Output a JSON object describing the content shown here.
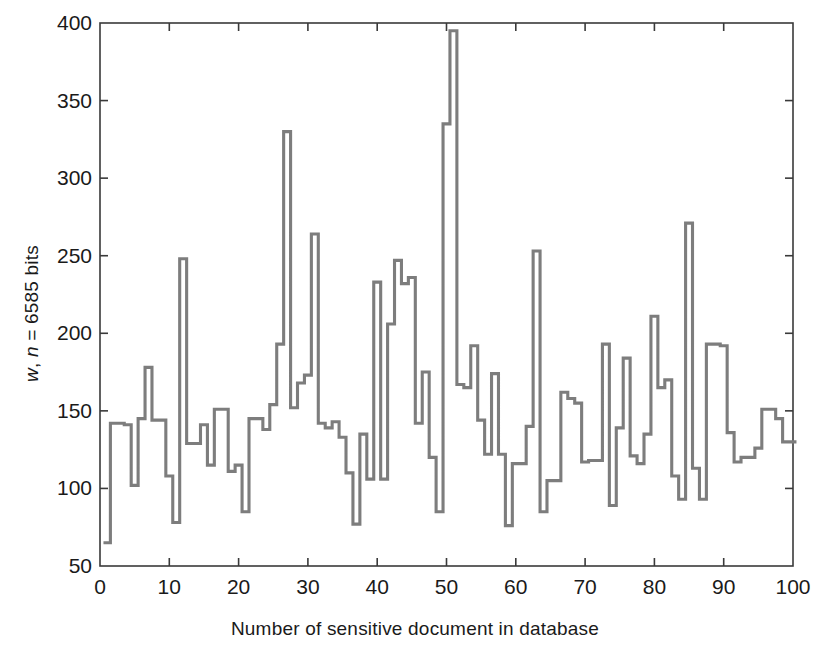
{
  "chart_data": {
    "type": "line",
    "subtype": "stairs",
    "title": "",
    "xlabel": "Number of sensitive document in database",
    "ylabel": "w, n = 6585 bits",
    "ylabel_parts": [
      {
        "text": "w",
        "italic": true
      },
      {
        "text": ", ",
        "italic": false
      },
      {
        "text": "n",
        "italic": true
      },
      {
        "text": " = 6585 bits",
        "italic": false
      }
    ],
    "xlim": [
      0,
      100
    ],
    "ylim": [
      50,
      400
    ],
    "xticks": [
      0,
      10,
      20,
      30,
      40,
      50,
      60,
      70,
      80,
      90,
      100
    ],
    "yticks": [
      50,
      100,
      150,
      200,
      250,
      300,
      350,
      400
    ],
    "grid": false,
    "legend": null,
    "line_color": "#7d7d7d",
    "axis_color": "#3a3a3a",
    "background": "#ffffff",
    "x": [
      1,
      2,
      3,
      4,
      5,
      6,
      7,
      8,
      9,
      10,
      11,
      12,
      13,
      14,
      15,
      16,
      17,
      18,
      19,
      20,
      21,
      22,
      23,
      24,
      25,
      26,
      27,
      28,
      29,
      30,
      31,
      32,
      33,
      34,
      35,
      36,
      37,
      38,
      39,
      40,
      41,
      42,
      43,
      44,
      45,
      46,
      47,
      48,
      49,
      50,
      51,
      52,
      53,
      54,
      55,
      56,
      57,
      58,
      59,
      60,
      61,
      62,
      63,
      64,
      65,
      66,
      67,
      68,
      69,
      70,
      71,
      72,
      73,
      74,
      75,
      76,
      77,
      78,
      79,
      80,
      81,
      82,
      83,
      84,
      85,
      86,
      87,
      88,
      89,
      90,
      91,
      92,
      93,
      94,
      95,
      96,
      97,
      98,
      99,
      100
    ],
    "values": [
      65,
      142,
      142,
      141,
      102,
      145,
      178,
      144,
      144,
      108,
      78,
      248,
      129,
      129,
      141,
      115,
      151,
      151,
      111,
      115,
      85,
      145,
      145,
      138,
      154,
      193,
      330,
      152,
      168,
      173,
      264,
      142,
      139,
      143,
      133,
      110,
      77,
      135,
      106,
      233,
      106,
      206,
      247,
      232,
      236,
      142,
      175,
      120,
      85,
      335,
      395,
      167,
      165,
      192,
      144,
      122,
      174,
      122,
      76,
      116,
      116,
      140,
      253,
      85,
      105,
      105,
      162,
      158,
      155,
      117,
      118,
      118,
      193,
      89,
      139,
      184,
      121,
      116,
      135,
      211,
      165,
      170,
      108,
      93,
      271,
      113,
      93,
      193,
      193,
      192,
      136,
      117,
      120,
      120,
      126,
      151,
      151,
      145,
      130,
      130
    ]
  },
  "axes_geometry": {
    "left_px": 100,
    "right_px": 793,
    "top_px": 23,
    "bottom_px": 566
  }
}
